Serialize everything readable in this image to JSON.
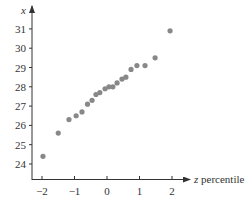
{
  "chart_data": {
    "type": "scatter",
    "title": "",
    "xlabel_var": "z",
    "xlabel_rest": " percentile",
    "xlabel": "z percentile",
    "ylabel": "x",
    "xlim": [
      -2.3,
      2.2
    ],
    "ylim": [
      23.3,
      31.5
    ],
    "grid": false,
    "legend": null,
    "x_ticks": [
      -2,
      -1,
      0,
      1,
      2
    ],
    "x_tick_labels": [
      "−2",
      "−1",
      "0",
      "1",
      "2"
    ],
    "y_ticks": [
      24,
      25,
      26,
      27,
      28,
      29,
      30,
      31
    ],
    "y_tick_labels": [
      "24",
      "25",
      "26",
      "27",
      "28",
      "29",
      "30",
      "31"
    ],
    "point_color": "#888888",
    "axis_color": "#333333",
    "series": [
      {
        "name": "normal quantile plot",
        "x": [
          -1.97,
          -1.5,
          -1.17,
          -0.95,
          -0.77,
          -0.6,
          -0.46,
          -0.34,
          -0.22,
          -0.06,
          0.06,
          0.18,
          0.31,
          0.46,
          0.58,
          0.74,
          0.92,
          1.17,
          1.48,
          1.94
        ],
        "y": [
          24.4,
          25.6,
          26.3,
          26.5,
          26.7,
          27.1,
          27.3,
          27.6,
          27.7,
          27.9,
          28.0,
          28.0,
          28.2,
          28.4,
          28.5,
          28.9,
          29.1,
          29.1,
          29.5,
          30.9
        ]
      }
    ]
  }
}
